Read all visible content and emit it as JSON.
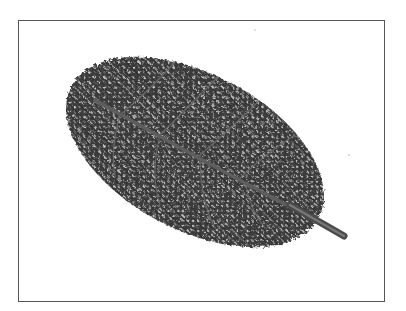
{
  "image": {
    "subject": "Skeletonized leaf with visible vein network",
    "alt": "Photograph of a skeletonized leaf showing a lace-like network of veins, with a central midrib and short stem, on a white background inside a thin gray frame"
  },
  "colors": {
    "background": "#ffffff",
    "frame": "#555555",
    "leaf_dark": "#2b2b2b",
    "leaf_mid": "#555555",
    "leaf_light": "#8a8a8a",
    "vein": "#666666"
  }
}
